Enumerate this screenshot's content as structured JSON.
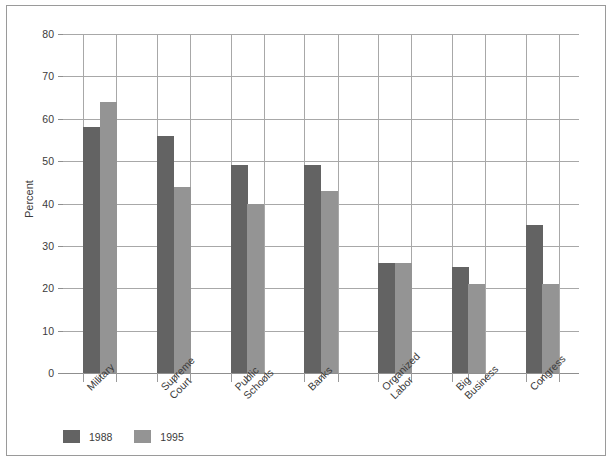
{
  "chart_data": {
    "type": "bar",
    "title": "",
    "xlabel": "",
    "ylabel": "Percent",
    "ylim": [
      0,
      80
    ],
    "ytick_step": 10,
    "yticks": [
      0,
      10,
      20,
      30,
      40,
      50,
      60,
      70,
      80
    ],
    "grid": true,
    "legend_position": "bottom-left",
    "categories": [
      "Military",
      "Supreme\nCourt",
      "Public\nSchools",
      "Banks",
      "Organized\nLabor",
      "Big\nBusiness",
      "Congress"
    ],
    "series": [
      {
        "name": "1988",
        "color": "#636363",
        "values": [
          58,
          56,
          49,
          49,
          26,
          25,
          35
        ]
      },
      {
        "name": "1995",
        "color": "#949494",
        "values": [
          64,
          44,
          40,
          43,
          26,
          21,
          21
        ]
      }
    ]
  },
  "colors": {
    "series_1988": "#636363",
    "series_1995": "#949494",
    "gridline": "#a8a8a8",
    "frame": "#9a9a9a",
    "text": "#3b3b3b"
  }
}
